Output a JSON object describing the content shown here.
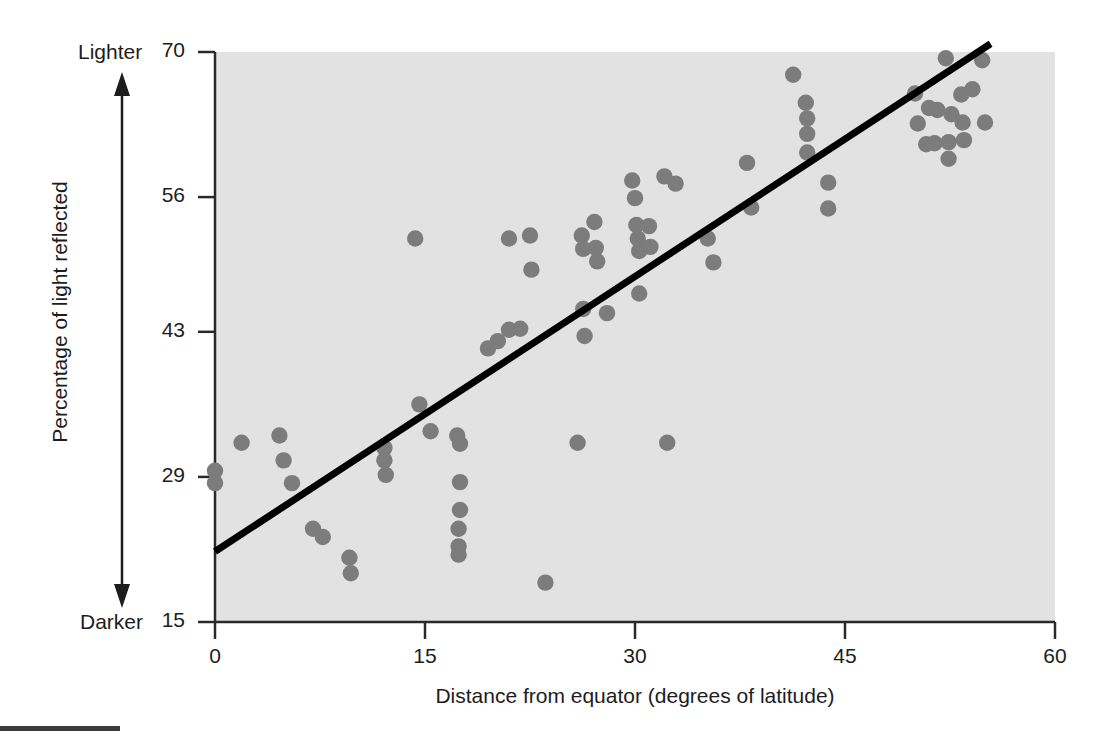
{
  "chart_data": {
    "type": "scatter",
    "title": "",
    "xlabel": "Distance from equator (degrees of latitude)",
    "ylabel": "Percentage of light reflected",
    "xticks": [
      0,
      15,
      30,
      45,
      60
    ],
    "yticks": [
      15,
      29,
      43,
      56,
      70
    ],
    "xlim": [
      0,
      60
    ],
    "ylim": [
      15,
      70
    ],
    "grid": false,
    "legend": null,
    "axis_annotations": {
      "y_top": "Lighter",
      "y_bottom": "Darker",
      "arrow": "double-headed vertical arrow"
    },
    "marker_color": "#7c7c7c",
    "trendline_color": "#000000",
    "plot_background": "#e2e2e2",
    "trendline": {
      "label": "regression line",
      "x0": 0.0,
      "y0": 21.8,
      "x1": 55.4,
      "y1": 70.8
    },
    "points": [
      {
        "x": 0.0,
        "y": 29.6
      },
      {
        "x": 0.0,
        "y": 28.4
      },
      {
        "x": 1.9,
        "y": 32.3
      },
      {
        "x": 4.6,
        "y": 33.0
      },
      {
        "x": 4.9,
        "y": 30.6
      },
      {
        "x": 5.5,
        "y": 28.4
      },
      {
        "x": 7.0,
        "y": 24.0
      },
      {
        "x": 7.7,
        "y": 23.2
      },
      {
        "x": 9.6,
        "y": 21.2
      },
      {
        "x": 9.7,
        "y": 19.7
      },
      {
        "x": 12.1,
        "y": 31.8
      },
      {
        "x": 12.1,
        "y": 30.6
      },
      {
        "x": 12.2,
        "y": 29.2
      },
      {
        "x": 14.3,
        "y": 52.0
      },
      {
        "x": 14.6,
        "y": 36.0
      },
      {
        "x": 15.4,
        "y": 33.4
      },
      {
        "x": 17.3,
        "y": 33.0
      },
      {
        "x": 17.5,
        "y": 32.2
      },
      {
        "x": 17.5,
        "y": 28.5
      },
      {
        "x": 17.5,
        "y": 25.8
      },
      {
        "x": 17.4,
        "y": 24.0
      },
      {
        "x": 17.4,
        "y": 22.3
      },
      {
        "x": 17.4,
        "y": 21.5
      },
      {
        "x": 19.5,
        "y": 41.4
      },
      {
        "x": 20.2,
        "y": 42.1
      },
      {
        "x": 21.0,
        "y": 52.0
      },
      {
        "x": 21.0,
        "y": 43.2
      },
      {
        "x": 21.8,
        "y": 43.3
      },
      {
        "x": 22.5,
        "y": 52.3
      },
      {
        "x": 22.6,
        "y": 49.0
      },
      {
        "x": 23.6,
        "y": 18.8
      },
      {
        "x": 25.9,
        "y": 32.3
      },
      {
        "x": 26.2,
        "y": 52.3
      },
      {
        "x": 26.3,
        "y": 51.0
      },
      {
        "x": 26.3,
        "y": 45.2
      },
      {
        "x": 26.4,
        "y": 42.6
      },
      {
        "x": 27.1,
        "y": 53.6
      },
      {
        "x": 27.2,
        "y": 51.1
      },
      {
        "x": 27.3,
        "y": 49.8
      },
      {
        "x": 28.0,
        "y": 44.8
      },
      {
        "x": 29.8,
        "y": 57.6
      },
      {
        "x": 30.0,
        "y": 55.9
      },
      {
        "x": 30.1,
        "y": 53.3
      },
      {
        "x": 30.2,
        "y": 52.0
      },
      {
        "x": 30.3,
        "y": 50.8
      },
      {
        "x": 30.3,
        "y": 46.7
      },
      {
        "x": 31.0,
        "y": 53.2
      },
      {
        "x": 31.1,
        "y": 51.2
      },
      {
        "x": 32.1,
        "y": 58.0
      },
      {
        "x": 32.3,
        "y": 32.3
      },
      {
        "x": 32.9,
        "y": 57.3
      },
      {
        "x": 35.2,
        "y": 52.0
      },
      {
        "x": 35.6,
        "y": 49.7
      },
      {
        "x": 38.0,
        "y": 59.3
      },
      {
        "x": 38.3,
        "y": 55.0
      },
      {
        "x": 41.3,
        "y": 67.8
      },
      {
        "x": 42.2,
        "y": 65.1
      },
      {
        "x": 42.3,
        "y": 63.6
      },
      {
        "x": 42.3,
        "y": 62.1
      },
      {
        "x": 42.3,
        "y": 60.3
      },
      {
        "x": 43.8,
        "y": 57.4
      },
      {
        "x": 43.8,
        "y": 54.9
      },
      {
        "x": 50.0,
        "y": 66.0
      },
      {
        "x": 50.2,
        "y": 63.1
      },
      {
        "x": 50.8,
        "y": 61.1
      },
      {
        "x": 51.0,
        "y": 64.6
      },
      {
        "x": 51.6,
        "y": 64.4
      },
      {
        "x": 51.4,
        "y": 61.2
      },
      {
        "x": 52.2,
        "y": 69.4
      },
      {
        "x": 52.6,
        "y": 64.0
      },
      {
        "x": 52.4,
        "y": 61.3
      },
      {
        "x": 52.4,
        "y": 59.7
      },
      {
        "x": 53.3,
        "y": 65.9
      },
      {
        "x": 53.4,
        "y": 63.2
      },
      {
        "x": 53.5,
        "y": 61.5
      },
      {
        "x": 54.1,
        "y": 66.4
      },
      {
        "x": 54.8,
        "y": 69.2
      },
      {
        "x": 55.0,
        "y": 63.2
      }
    ]
  }
}
